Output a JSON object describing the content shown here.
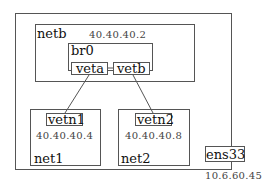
{
  "diagram": {
    "host": {
      "label": ""
    },
    "netb": {
      "name": "netb",
      "ip": "40.40.40.2"
    },
    "br0": {
      "name": "br0"
    },
    "veta": {
      "name": "veta"
    },
    "vetb": {
      "name": "vetb"
    },
    "net1": {
      "name": "net1",
      "iface": "vetn1",
      "ip": "40.40.40.4"
    },
    "net2": {
      "name": "net2",
      "iface": "vetn2",
      "ip": "40.40.40.8"
    },
    "ens33": {
      "name": "ens33",
      "ip": "10.6.60.45"
    },
    "links": [
      {
        "from": "veta",
        "to": "vetb"
      },
      {
        "from": "veta",
        "to": "vetn1"
      },
      {
        "from": "vetb",
        "to": "vetn2"
      }
    ]
  }
}
